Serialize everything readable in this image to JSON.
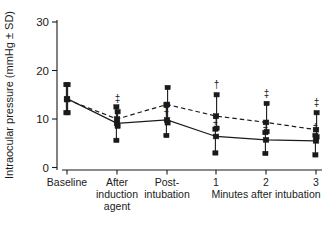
{
  "chart_data": {
    "type": "line",
    "title": "",
    "subtitle": "",
    "xlabel": "Minutes after intubation",
    "ylabel": "Intraocular pressure (mmHg ± SD)",
    "categories": [
      "Baseline",
      "After induction agent",
      "Post-intubation",
      "1",
      "2",
      "3"
    ],
    "category_lines": [
      [
        "Baseline"
      ],
      [
        "After",
        "induction",
        "agent"
      ],
      [
        "Post-",
        "intubation"
      ],
      [
        "1"
      ],
      [
        "2"
      ],
      [
        "3"
      ]
    ],
    "ylim": [
      0,
      30
    ],
    "yticks": [
      0,
      10,
      20,
      30
    ],
    "ytick_labels": [
      "0",
      "10",
      "20",
      "30"
    ],
    "grid": false,
    "legend": "none",
    "series": [
      {
        "name": "solid",
        "style": "solid",
        "marker": "square",
        "values": [
          14.2,
          9.1,
          9.8,
          6.4,
          5.7,
          5.5
        ],
        "err_low": [
          11.3,
          5.6,
          6.6,
          3.0,
          2.9,
          2.6
        ],
        "err_high": [
          17.1,
          12.5,
          12.9,
          7.9,
          7.2,
          6.6
        ]
      },
      {
        "name": "dashed",
        "style": "dashed",
        "marker": "square",
        "values": [
          14.0,
          10.0,
          13.0,
          10.6,
          9.3,
          7.8
        ],
        "err_low": [
          11.3,
          8.5,
          9.2,
          8.1,
          7.4,
          6.3
        ],
        "err_high": [
          17.1,
          11.5,
          16.5,
          15.0,
          13.2,
          11.3
        ]
      }
    ],
    "annotations": [
      {
        "text": "†",
        "series": "dashed",
        "category_index": 3,
        "value": 16.4
      },
      {
        "text": "‡",
        "series": "dashed",
        "category_index": 4,
        "value": 14.6
      },
      {
        "text": "‡",
        "series": "dashed",
        "category_index": 5,
        "value": 12.7
      },
      {
        "text": "‡",
        "series": "solid",
        "category_index": 2,
        "value": 11.2
      },
      {
        "text": "‡",
        "series": "solid",
        "category_index": 3,
        "value": 8.9
      },
      {
        "text": "‡",
        "series": "solid",
        "category_index": 4,
        "value": 8.0
      },
      {
        "text": "‡",
        "series": "solid",
        "category_index": 5,
        "value": 7.5
      },
      {
        "text": "‡",
        "series": "dashed",
        "category_index": 1,
        "value": 13.5
      }
    ]
  }
}
